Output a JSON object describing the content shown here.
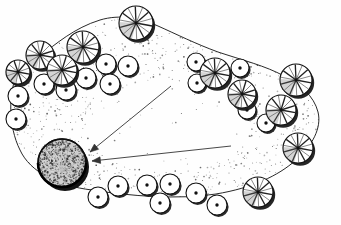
{
  "document": {
    "kind": "landscape-planting-plan",
    "title": "Landscape Planting Plan",
    "medium": "hand-drawn ink line drawing",
    "canvas": {
      "width": 341,
      "height": 225
    },
    "background_color": "#fefefe",
    "ink_color": "#111111",
    "shadow_color": "#1a1a1a",
    "stipple_color": "#3a3a3a",
    "accent_color": "#555555"
  },
  "planting_bed": {
    "name": "mulch-bed",
    "outline_color": "#333333",
    "fill_texture": "stipple",
    "outline_path": "M 18 72 C 8 92 8 126 20 150 C 30 172 58 186 92 190 C 130 196 178 200 216 194 C 252 188 278 176 296 160 C 312 146 322 128 318 112 C 314 96 300 84 284 76 C 266 66 242 60 218 52 C 196 44 176 34 158 26 C 140 18 120 14 100 20 C 74 28 56 44 40 56 C 30 63 23 66 18 72 Z",
    "stipple_seed": 7,
    "stipple_density": "medium"
  },
  "featured_tree": {
    "name": "specimen-tree",
    "label": "featured deciduous specimen tree",
    "cx": 62,
    "cy": 163,
    "r": 24,
    "canopy_fill": "#cfcfcf",
    "canopy_texture": "stipple-and-branch",
    "shadow_offset_x": 3,
    "shadow_offset_y": 4
  },
  "callout_arrows": [
    {
      "name": "callout-arrow-upper",
      "from_x": 171,
      "from_y": 86,
      "to_x": 90,
      "to_y": 152,
      "head_size": 9,
      "color": "#333333"
    },
    {
      "name": "callout-arrow-lower",
      "from_x": 231,
      "from_y": 146,
      "to_x": 92,
      "to_y": 161,
      "head_size": 9,
      "color": "#333333"
    }
  ],
  "spoke_trees": [
    {
      "cx": 136,
      "cy": 23,
      "r": 17,
      "spokes": 14
    },
    {
      "cx": 83,
      "cy": 47,
      "r": 16,
      "spokes": 14
    },
    {
      "cx": 40,
      "cy": 55,
      "r": 14,
      "spokes": 13
    },
    {
      "cx": 62,
      "cy": 70,
      "r": 15,
      "spokes": 13
    },
    {
      "cx": 18,
      "cy": 72,
      "r": 12,
      "spokes": 12
    },
    {
      "cx": 215,
      "cy": 73,
      "r": 15,
      "spokes": 14
    },
    {
      "cx": 242,
      "cy": 94,
      "r": 14,
      "spokes": 13
    },
    {
      "cx": 296,
      "cy": 80,
      "r": 16,
      "spokes": 14
    },
    {
      "cx": 281,
      "cy": 110,
      "r": 15,
      "spokes": 13
    },
    {
      "cx": 298,
      "cy": 148,
      "r": 15,
      "spokes": 14
    },
    {
      "cx": 258,
      "cy": 192,
      "r": 15,
      "spokes": 14
    }
  ],
  "shrubs": [
    {
      "cx": 106,
      "cy": 64,
      "r": 10
    },
    {
      "cx": 128,
      "cy": 66,
      "r": 10
    },
    {
      "cx": 86,
      "cy": 78,
      "r": 10
    },
    {
      "cx": 110,
      "cy": 84,
      "r": 10
    },
    {
      "cx": 44,
      "cy": 84,
      "r": 10
    },
    {
      "cx": 66,
      "cy": 90,
      "r": 10
    },
    {
      "cx": 18,
      "cy": 96,
      "r": 10
    },
    {
      "cx": 16,
      "cy": 119,
      "r": 10
    },
    {
      "cx": 196,
      "cy": 62,
      "r": 9
    },
    {
      "cx": 197,
      "cy": 83,
      "r": 9
    },
    {
      "cx": 240,
      "cy": 68,
      "r": 9
    },
    {
      "cx": 247,
      "cy": 110,
      "r": 9
    },
    {
      "cx": 266,
      "cy": 123,
      "r": 9
    },
    {
      "cx": 118,
      "cy": 186,
      "r": 10
    },
    {
      "cx": 98,
      "cy": 197,
      "r": 10
    },
    {
      "cx": 147,
      "cy": 185,
      "r": 10
    },
    {
      "cx": 170,
      "cy": 184,
      "r": 10
    },
    {
      "cx": 160,
      "cy": 203,
      "r": 10
    },
    {
      "cx": 196,
      "cy": 193,
      "r": 10
    },
    {
      "cx": 217,
      "cy": 205,
      "r": 10
    }
  ]
}
